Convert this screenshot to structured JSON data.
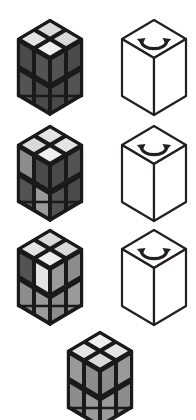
{
  "canvas": {
    "width": 196,
    "height": 420,
    "background": "#ffffff",
    "title": "Rubik's cube rotation sequence"
  },
  "palette": {
    "edge": "#1a1a1a",
    "outline": "#231f20",
    "white_face": "#ffffff",
    "dark": "#4a4a4a",
    "dark2": "#535353",
    "mid": "#8c8c8c",
    "mid2": "#9a9a9a",
    "light": "#d9d9d9",
    "light2": "#e4e4e4",
    "lightest": "#f0f0f0"
  },
  "geometry": {
    "cube_width": 64,
    "cube_height": 76,
    "top_rise": 19
  },
  "rows": [
    {
      "index": 1,
      "y": 18,
      "items": [
        {
          "kind": "rubiks-cube",
          "name": "rubiks-cube-step-1",
          "x": 16,
          "label": "",
          "top": [
            "light2",
            "light",
            "lightest",
            "light"
          ],
          "front": [
            "dark",
            "dark2",
            "dark2",
            "dark"
          ],
          "right": [
            "dark2",
            "dark",
            "dark",
            "dark2"
          ]
        },
        {
          "kind": "outline-cube",
          "name": "rotation-cube-step-1",
          "x": 120,
          "label": "",
          "arrow": "rotate-ccw-arrow"
        }
      ]
    },
    {
      "index": 2,
      "y": 124,
      "items": [
        {
          "kind": "rubiks-cube",
          "name": "rubiks-cube-step-2",
          "x": 16,
          "label": "",
          "top": [
            "light",
            "light2",
            "lightest",
            "light2"
          ],
          "front": [
            "mid",
            "dark",
            "dark2",
            "mid2"
          ],
          "right": [
            "dark",
            "dark2",
            "dark2",
            "dark"
          ]
        },
        {
          "kind": "outline-cube",
          "name": "rotation-cube-step-2",
          "x": 120,
          "label": "",
          "arrow": "rotate-ccw-arrow"
        }
      ]
    },
    {
      "index": 3,
      "y": 228,
      "items": [
        {
          "kind": "rubiks-cube",
          "name": "rubiks-cube-step-3",
          "x": 16,
          "label": "",
          "top": [
            "light2",
            "light",
            "lightest",
            "light"
          ],
          "front": [
            "dark2",
            "light2",
            "mid",
            "mid2"
          ],
          "right": [
            "mid2",
            "mid",
            "mid",
            "mid2"
          ]
        },
        {
          "kind": "outline-cube",
          "name": "rotation-cube-step-3",
          "x": 120,
          "label": "",
          "arrow": "rotate-ccw-arrow"
        }
      ]
    },
    {
      "index": 4,
      "y": 330,
      "items": [
        {
          "kind": "rubiks-cube",
          "name": "rubiks-cube-step-4",
          "x": 66,
          "label": "",
          "top": [
            "light2",
            "lightest",
            "light",
            "light2"
          ],
          "front": [
            "mid2",
            "mid",
            "mid",
            "mid2"
          ],
          "right": [
            "mid",
            "mid2",
            "mid2",
            "mid"
          ]
        }
      ]
    }
  ]
}
